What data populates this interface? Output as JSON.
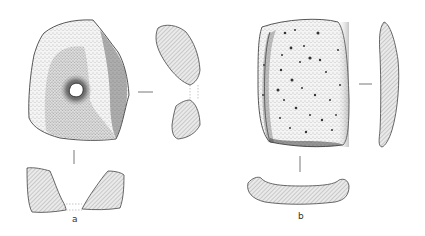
{
  "figure": {
    "artifacts": [
      {
        "id": "a",
        "label": "a",
        "description": "perforated stone with central hole, front view and two cross-sections"
      },
      {
        "id": "b",
        "label": "b",
        "description": "rectangular pitted stone slab, front view and two cross-sections"
      }
    ]
  },
  "colors": {
    "outline": "#444444",
    "hatch": "#888888",
    "section_fill": "#e6e6e6",
    "stipple_dark": "#555555",
    "background": "#ffffff"
  }
}
